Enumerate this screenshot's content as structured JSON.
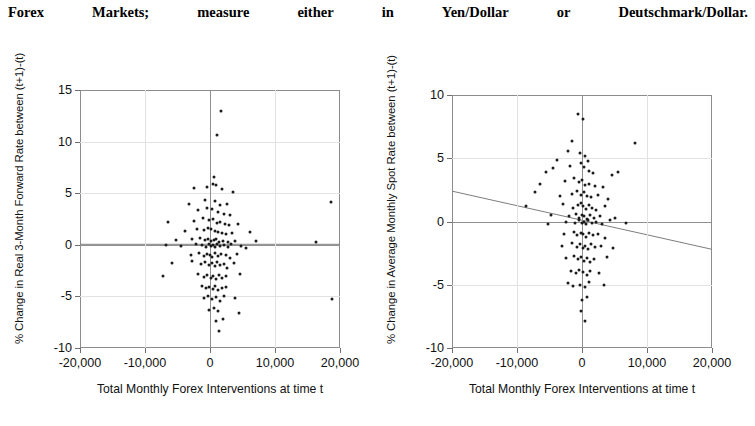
{
  "header": {
    "words": [
      "Forex",
      "Markets;",
      "measure",
      "either",
      "in",
      "Yen/Dollar",
      "or",
      "Deutschmark/Dollar."
    ],
    "full_text": "Forex Markets; measure either in Yen/Dollar or Deutschmark/Dollar."
  },
  "chart_data": [
    {
      "id": "left",
      "type": "scatter",
      "title": "",
      "xlabel": "Total Monthly Forex Interventions at time t",
      "ylabel": "% Change in Real 3-Month Forward Rate between (t+1)-(t)",
      "xlim": [
        -20000,
        20000
      ],
      "ylim": [
        -10,
        15
      ],
      "xticks": [
        -20000,
        -10000,
        0,
        10000,
        20000
      ],
      "xtick_labels": [
        "-20,000",
        "-10,000",
        "0",
        "10,000",
        "20,000"
      ],
      "yticks": [
        -10,
        -5,
        0,
        5,
        10,
        15
      ],
      "ytick_labels": [
        "-10",
        "-5",
        "0",
        "5",
        "10",
        "15"
      ],
      "grid": true,
      "legend": "none",
      "trendline": {
        "x1": -20000,
        "y1": 0.05,
        "x2": 20000,
        "y2": 0.05,
        "slope": 0.0
      },
      "points": [
        [
          1700,
          13.0
        ],
        [
          1100,
          10.6
        ],
        [
          600,
          6.6
        ],
        [
          400,
          5.9
        ],
        [
          900,
          5.8
        ],
        [
          -2500,
          5.5
        ],
        [
          -400,
          5.6
        ],
        [
          1900,
          5.4
        ],
        [
          3600,
          5.1
        ],
        [
          -3300,
          4.0
        ],
        [
          -700,
          4.3
        ],
        [
          700,
          4.2
        ],
        [
          1600,
          3.9
        ],
        [
          2600,
          4.0
        ],
        [
          18600,
          4.1
        ],
        [
          -1800,
          3.4
        ],
        [
          -500,
          3.6
        ],
        [
          300,
          3.5
        ],
        [
          1200,
          3.2
        ],
        [
          2100,
          3.0
        ],
        [
          3100,
          2.9
        ],
        [
          -6500,
          2.2
        ],
        [
          -2400,
          2.3
        ],
        [
          -1100,
          2.6
        ],
        [
          -200,
          2.4
        ],
        [
          500,
          2.5
        ],
        [
          1000,
          2.1
        ],
        [
          1500,
          2.2
        ],
        [
          2300,
          2.0
        ],
        [
          2900,
          1.9
        ],
        [
          4300,
          2.0
        ],
        [
          -3800,
          1.3
        ],
        [
          -2000,
          1.5
        ],
        [
          -900,
          1.4
        ],
        [
          -300,
          1.6
        ],
        [
          200,
          1.5
        ],
        [
          700,
          1.3
        ],
        [
          1300,
          1.2
        ],
        [
          1800,
          1.1
        ],
        [
          2500,
          1.0
        ],
        [
          3400,
          1.1
        ],
        [
          6200,
          1.2
        ],
        [
          -5200,
          0.5
        ],
        [
          -2700,
          0.6
        ],
        [
          -1500,
          0.7
        ],
        [
          -800,
          0.5
        ],
        [
          -250,
          0.6
        ],
        [
          150,
          0.4
        ],
        [
          600,
          0.5
        ],
        [
          950,
          0.6
        ],
        [
          1400,
          0.3
        ],
        [
          2000,
          0.4
        ],
        [
          2800,
          0.3
        ],
        [
          3900,
          0.4
        ],
        [
          7000,
          0.4
        ],
        [
          16300,
          0.3
        ],
        [
          -6800,
          0.0
        ],
        [
          -4500,
          -0.1
        ],
        [
          -2200,
          0.1
        ],
        [
          -1200,
          0.0
        ],
        [
          -600,
          -0.2
        ],
        [
          -150,
          0.1
        ],
        [
          100,
          -0.1
        ],
        [
          450,
          0.0
        ],
        [
          800,
          -0.2
        ],
        [
          1150,
          0.1
        ],
        [
          1600,
          -0.1
        ],
        [
          2200,
          0.0
        ],
        [
          2700,
          -0.2
        ],
        [
          3300,
          0.1
        ],
        [
          4700,
          -0.1
        ],
        [
          5600,
          -0.3
        ],
        [
          -3000,
          -1.0
        ],
        [
          -1700,
          -0.8
        ],
        [
          -1000,
          -1.1
        ],
        [
          -450,
          -0.9
        ],
        [
          0,
          -1.0
        ],
        [
          350,
          -1.2
        ],
        [
          750,
          -0.8
        ],
        [
          1250,
          -1.1
        ],
        [
          1700,
          -0.9
        ],
        [
          2400,
          -1.0
        ],
        [
          3000,
          -1.3
        ],
        [
          4100,
          -0.9
        ],
        [
          -5800,
          -1.8
        ],
        [
          -2800,
          -1.6
        ],
        [
          -1400,
          -1.9
        ],
        [
          -700,
          -1.7
        ],
        [
          -200,
          -2.0
        ],
        [
          250,
          -1.8
        ],
        [
          700,
          -2.1
        ],
        [
          1100,
          -1.7
        ],
        [
          1500,
          -2.0
        ],
        [
          2100,
          -1.9
        ],
        [
          2600,
          -2.2
        ],
        [
          3700,
          -1.8
        ],
        [
          -7300,
          -3.0
        ],
        [
          -1900,
          -2.8
        ],
        [
          -1000,
          -3.1
        ],
        [
          -400,
          -2.9
        ],
        [
          100,
          -3.2
        ],
        [
          500,
          -3.0
        ],
        [
          900,
          -3.3
        ],
        [
          1400,
          -2.9
        ],
        [
          1900,
          -3.2
        ],
        [
          2500,
          -3.0
        ],
        [
          4600,
          -2.8
        ],
        [
          -1300,
          -4.0
        ],
        [
          -600,
          -4.2
        ],
        [
          -100,
          -4.1
        ],
        [
          400,
          -4.3
        ],
        [
          800,
          -4.0
        ],
        [
          1300,
          -4.4
        ],
        [
          1800,
          -4.2
        ],
        [
          2400,
          -4.1
        ],
        [
          -900,
          -5.2
        ],
        [
          -300,
          -5.0
        ],
        [
          300,
          -5.3
        ],
        [
          900,
          -5.1
        ],
        [
          1500,
          -5.4
        ],
        [
          2200,
          -5.0
        ],
        [
          3800,
          -5.2
        ],
        [
          18800,
          -5.3
        ],
        [
          -200,
          -6.3
        ],
        [
          600,
          -6.1
        ],
        [
          1200,
          -6.4
        ],
        [
          4400,
          -6.6
        ],
        [
          900,
          -7.4
        ],
        [
          2000,
          -7.2
        ],
        [
          1400,
          -8.4
        ]
      ]
    },
    {
      "id": "right",
      "type": "scatter",
      "title": "",
      "xlabel": "Total Monthly Forex Interventions at time t",
      "ylabel": "% Change in Average Monthly Spot Rate between (t+1)-(t)",
      "xlim": [
        -20000,
        20000
      ],
      "ylim": [
        -10,
        10
      ],
      "xticks": [
        -20000,
        -10000,
        0,
        10000,
        20000
      ],
      "xtick_labels": [
        "-20,000",
        "-10,000",
        "0",
        "10,000",
        "20,000"
      ],
      "yticks": [
        -10,
        -5,
        0,
        5,
        10
      ],
      "ytick_labels": [
        "-10",
        "-5",
        "0",
        "5",
        "10"
      ],
      "grid": true,
      "legend": "none",
      "trendline": {
        "x1": -20000,
        "y1": 2.4,
        "x2": 20000,
        "y2": -2.2,
        "slope": -0.000115
      },
      "points": [
        [
          -600,
          8.5
        ],
        [
          200,
          8.1
        ],
        [
          -1500,
          6.4
        ],
        [
          -2200,
          5.6
        ],
        [
          8200,
          6.2
        ],
        [
          -3900,
          4.9
        ],
        [
          -300,
          5.4
        ],
        [
          400,
          5.2
        ],
        [
          900,
          4.8
        ],
        [
          -4400,
          4.2
        ],
        [
          -5600,
          3.9
        ],
        [
          -1800,
          4.4
        ],
        [
          -200,
          4.6
        ],
        [
          300,
          4.3
        ],
        [
          1000,
          4.0
        ],
        [
          1700,
          3.8
        ],
        [
          4600,
          3.7
        ],
        [
          5600,
          3.9
        ],
        [
          -6400,
          3.0
        ],
        [
          -2600,
          3.2
        ],
        [
          -1200,
          3.4
        ],
        [
          -500,
          3.1
        ],
        [
          0,
          3.3
        ],
        [
          500,
          2.9
        ],
        [
          1100,
          3.0
        ],
        [
          2000,
          2.8
        ],
        [
          3300,
          2.7
        ],
        [
          -7300,
          2.3
        ],
        [
          -3400,
          2.0
        ],
        [
          -1600,
          2.2
        ],
        [
          -700,
          2.4
        ],
        [
          -150,
          2.1
        ],
        [
          250,
          2.3
        ],
        [
          700,
          2.0
        ],
        [
          1400,
          1.9
        ],
        [
          2400,
          2.1
        ],
        [
          4000,
          1.8
        ],
        [
          -8600,
          1.2
        ],
        [
          -2900,
          1.4
        ],
        [
          -1400,
          1.1
        ],
        [
          -600,
          1.3
        ],
        [
          -100,
          1.5
        ],
        [
          200,
          1.2
        ],
        [
          600,
          1.0
        ],
        [
          1000,
          1.3
        ],
        [
          1600,
          1.1
        ],
        [
          2200,
          0.9
        ],
        [
          3600,
          1.2
        ],
        [
          -4800,
          0.5
        ],
        [
          -2000,
          0.4
        ],
        [
          -1000,
          0.6
        ],
        [
          -400,
          0.3
        ],
        [
          0,
          0.5
        ],
        [
          300,
          0.4
        ],
        [
          700,
          0.2
        ],
        [
          1200,
          0.5
        ],
        [
          1800,
          0.3
        ],
        [
          2700,
          0.4
        ],
        [
          5100,
          0.3
        ],
        [
          -5200,
          -0.2
        ],
        [
          -2400,
          0.0
        ],
        [
          -1100,
          -0.1
        ],
        [
          -500,
          0.1
        ],
        [
          -50,
          -0.1
        ],
        [
          250,
          0.0
        ],
        [
          600,
          -0.2
        ],
        [
          950,
          0.1
        ],
        [
          1500,
          -0.1
        ],
        [
          2100,
          0.0
        ],
        [
          3000,
          -0.2
        ],
        [
          4300,
          0.1
        ],
        [
          6700,
          -0.1
        ],
        [
          -2700,
          -1.0
        ],
        [
          -1300,
          -0.8
        ],
        [
          -700,
          -1.1
        ],
        [
          -200,
          -0.9
        ],
        [
          200,
          -1.0
        ],
        [
          600,
          -1.2
        ],
        [
          1100,
          -0.9
        ],
        [
          1700,
          -1.1
        ],
        [
          2500,
          -1.0
        ],
        [
          3500,
          -1.3
        ],
        [
          -3100,
          -1.9
        ],
        [
          -1500,
          -1.7
        ],
        [
          -800,
          -2.0
        ],
        [
          -300,
          -1.8
        ],
        [
          100,
          -2.1
        ],
        [
          500,
          -1.9
        ],
        [
          900,
          -2.2
        ],
        [
          1400,
          -1.8
        ],
        [
          2000,
          -2.0
        ],
        [
          2900,
          -1.9
        ],
        [
          4800,
          -2.1
        ],
        [
          -2500,
          -2.9
        ],
        [
          -1200,
          -2.7
        ],
        [
          -600,
          -3.0
        ],
        [
          -100,
          -2.8
        ],
        [
          300,
          -3.1
        ],
        [
          800,
          -2.9
        ],
        [
          1300,
          -3.2
        ],
        [
          1900,
          -3.0
        ],
        [
          3800,
          -2.8
        ],
        [
          -1700,
          -3.9
        ],
        [
          -900,
          -4.1
        ],
        [
          -400,
          -3.8
        ],
        [
          200,
          -4.0
        ],
        [
          700,
          -4.2
        ],
        [
          1200,
          -3.9
        ],
        [
          2600,
          -4.1
        ],
        [
          -2100,
          -4.9
        ],
        [
          -1400,
          -5.1
        ],
        [
          -300,
          -5.0
        ],
        [
          400,
          -5.2
        ],
        [
          1000,
          -4.8
        ],
        [
          3400,
          -5.0
        ],
        [
          0,
          -6.2
        ],
        [
          700,
          -6.0
        ],
        [
          -100,
          -7.1
        ],
        [
          500,
          -7.9
        ]
      ]
    }
  ]
}
